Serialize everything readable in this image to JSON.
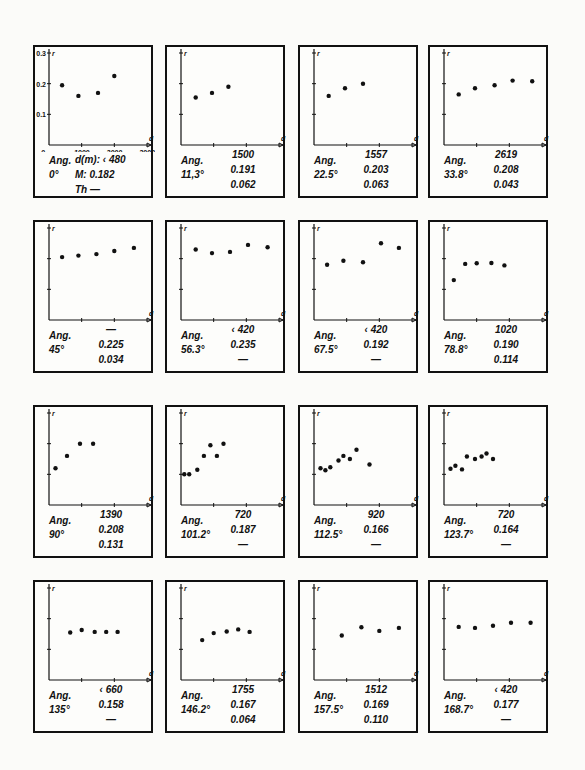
{
  "chart_data": {
    "type": "scatter",
    "layout": "4x4 grid of small multiples",
    "xlabel": "d",
    "ylabel": "r",
    "xlim": [
      0,
      3000
    ],
    "ylim": [
      0,
      0.3
    ],
    "x_ticks": [
      "0",
      "1000",
      "2000",
      "3000"
    ],
    "y_ticks": [
      "0.1",
      "0.2",
      "0.3"
    ],
    "grid": false,
    "panels": [
      {
        "angle_label": "Ang.",
        "angle": "0°",
        "d": "d(m): ‹ 480",
        "M": "M: 0.182",
        "Th": "Th  —",
        "points": [
          [
            400,
            0.195
          ],
          [
            900,
            0.16
          ],
          [
            1500,
            0.17
          ],
          [
            2000,
            0.225
          ]
        ]
      },
      {
        "angle_label": "Ang.",
        "angle": "11,3°",
        "d": "1500",
        "M": "0.191",
        "Th": "0.062",
        "points": [
          [
            450,
            0.155
          ],
          [
            950,
            0.17
          ],
          [
            1450,
            0.19
          ]
        ]
      },
      {
        "angle_label": "Ang.",
        "angle": "22.5°",
        "d": "1557",
        "M": "0.203",
        "Th": "0.063",
        "points": [
          [
            450,
            0.16
          ],
          [
            950,
            0.185
          ],
          [
            1500,
            0.2
          ]
        ]
      },
      {
        "angle_label": "Ang.",
        "angle": "33.8°",
        "d": "2619",
        "M": "0.208",
        "Th": "0.043",
        "points": [
          [
            450,
            0.165
          ],
          [
            950,
            0.185
          ],
          [
            1550,
            0.195
          ],
          [
            2100,
            0.21
          ],
          [
            2700,
            0.208
          ]
        ]
      },
      {
        "angle_label": "Ang.",
        "angle": "45°",
        "d": "—",
        "M": "0.225",
        "Th": "0.034",
        "points": [
          [
            400,
            0.205
          ],
          [
            900,
            0.21
          ],
          [
            1450,
            0.215
          ],
          [
            2000,
            0.225
          ],
          [
            2600,
            0.235
          ]
        ]
      },
      {
        "angle_label": "Ang.",
        "angle": "56.3°",
        "d": "‹ 420",
        "M": "0.235",
        "Th": "—",
        "points": [
          [
            450,
            0.23
          ],
          [
            950,
            0.218
          ],
          [
            1500,
            0.222
          ],
          [
            2050,
            0.245
          ],
          [
            2650,
            0.237
          ]
        ]
      },
      {
        "angle_label": "Ang.",
        "angle": "67.5°",
        "d": "‹ 420",
        "M": "0.192",
        "Th": "—",
        "points": [
          [
            400,
            0.18
          ],
          [
            900,
            0.193
          ],
          [
            1500,
            0.188
          ],
          [
            2050,
            0.25
          ],
          [
            2600,
            0.235
          ]
        ]
      },
      {
        "angle_label": "Ang.",
        "angle": "78.8°",
        "d": "1020",
        "M": "0.190",
        "Th": "0.114",
        "points": [
          [
            300,
            0.13
          ],
          [
            650,
            0.183
          ],
          [
            1000,
            0.185
          ],
          [
            1450,
            0.186
          ],
          [
            1850,
            0.178
          ]
        ]
      },
      {
        "angle_label": "Ang.",
        "angle": "90°",
        "d": "1390",
        "M": "0.208",
        "Th": "0.131",
        "points": [
          [
            200,
            0.12
          ],
          [
            550,
            0.16
          ],
          [
            950,
            0.2
          ],
          [
            1350,
            0.2
          ]
        ]
      },
      {
        "angle_label": "Ang.",
        "angle": "101.2°",
        "d": "720",
        "M": "0.187",
        "Th": "—",
        "points": [
          [
            100,
            0.1
          ],
          [
            250,
            0.1
          ],
          [
            500,
            0.115
          ],
          [
            700,
            0.16
          ],
          [
            900,
            0.195
          ],
          [
            1100,
            0.16
          ],
          [
            1300,
            0.2
          ]
        ]
      },
      {
        "angle_label": "Ang.",
        "angle": "112.5°",
        "d": "920",
        "M": "0.166",
        "Th": "—",
        "points": [
          [
            200,
            0.12
          ],
          [
            350,
            0.113
          ],
          [
            500,
            0.123
          ],
          [
            750,
            0.145
          ],
          [
            900,
            0.16
          ],
          [
            1100,
            0.15
          ],
          [
            1300,
            0.18
          ],
          [
            1700,
            0.132
          ]
        ]
      },
      {
        "angle_label": "Ang.",
        "angle": "123.7°",
        "d": "720",
        "M": "0.164",
        "Th": "—",
        "points": [
          [
            200,
            0.118
          ],
          [
            350,
            0.128
          ],
          [
            550,
            0.116
          ],
          [
            700,
            0.158
          ],
          [
            950,
            0.15
          ],
          [
            1150,
            0.158
          ],
          [
            1300,
            0.168
          ],
          [
            1500,
            0.15
          ]
        ]
      },
      {
        "angle_label": "Ang.",
        "angle": "135°",
        "d": "‹ 660",
        "M": "0.158",
        "Th": "—",
        "points": [
          [
            650,
            0.155
          ],
          [
            1000,
            0.163
          ],
          [
            1400,
            0.157
          ],
          [
            1750,
            0.157
          ],
          [
            2100,
            0.157
          ]
        ]
      },
      {
        "angle_label": "Ang.",
        "angle": "146.2°",
        "d": "1755",
        "M": "0.167",
        "Th": "0.064",
        "points": [
          [
            650,
            0.13
          ],
          [
            1000,
            0.153
          ],
          [
            1400,
            0.158
          ],
          [
            1750,
            0.165
          ],
          [
            2100,
            0.157
          ]
        ]
      },
      {
        "angle_label": "Ang.",
        "angle": "157.5°",
        "d": "1512",
        "M": "0.169",
        "Th": "0.110",
        "points": [
          [
            850,
            0.145
          ],
          [
            1450,
            0.172
          ],
          [
            2000,
            0.16
          ],
          [
            2600,
            0.17
          ]
        ]
      },
      {
        "angle_label": "Ang.",
        "angle": "168.7°",
        "d": "‹ 420",
        "M": "0.177",
        "Th": "—",
        "points": [
          [
            450,
            0.173
          ],
          [
            950,
            0.17
          ],
          [
            1500,
            0.177
          ],
          [
            2050,
            0.187
          ],
          [
            2650,
            0.187
          ]
        ]
      }
    ]
  }
}
